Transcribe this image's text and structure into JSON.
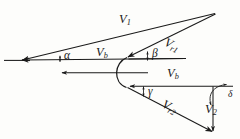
{
  "diagram": {
    "type": "vector-velocity-diagram",
    "stroke_color": "#1a1a1a",
    "background_color": "#fdfdfb",
    "canvas": {
      "width": 240,
      "height": 139
    }
  },
  "labels": {
    "v1": {
      "base": "V",
      "sub": "1"
    },
    "vr1": {
      "base": "V",
      "sub": "r1"
    },
    "vb_top": {
      "base": "V",
      "sub": "b"
    },
    "vb_bottom": {
      "base": "V",
      "sub": "b"
    },
    "vr2": {
      "base": "V",
      "sub": "r2"
    },
    "v2": {
      "base": "V",
      "sub": "2"
    }
  },
  "angles": {
    "alpha": "α",
    "beta": "β",
    "gamma": "γ",
    "delta": "δ"
  },
  "vectors": [
    {
      "name": "V1",
      "label": "V1",
      "description": "absolute inlet velocity",
      "from": [
        215,
        14
      ],
      "to": [
        22,
        60
      ]
    },
    {
      "name": "Vr1",
      "label": "Vr1",
      "description": "relative inlet velocity",
      "from": [
        215,
        14
      ],
      "to": [
        128,
        57
      ]
    },
    {
      "name": "Vb-top",
      "label": "Vb",
      "description": "blade velocity upper",
      "from": [
        128,
        58
      ],
      "to": [
        22,
        60
      ]
    },
    {
      "name": "Vb-mid",
      "label": "Vb",
      "description": "blade velocity middle",
      "from": [
        148,
        73
      ],
      "to": [
        62,
        73
      ]
    },
    {
      "name": "Vb-low",
      "label": "Vb",
      "description": "blade velocity lower",
      "from": [
        232,
        86
      ],
      "to": [
        130,
        86
      ]
    },
    {
      "name": "Vr2",
      "label": "Vr2",
      "description": "relative outlet velocity",
      "from": [
        128,
        87
      ],
      "to": [
        213,
        132
      ]
    },
    {
      "name": "V2",
      "label": "V2",
      "description": "absolute outlet velocity",
      "from": [
        213,
        86
      ],
      "to": [
        213,
        132
      ]
    }
  ]
}
